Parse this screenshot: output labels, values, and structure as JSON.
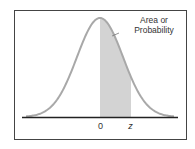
{
  "diagram": {
    "type": "standard-normal-curve",
    "annotation_line1": "Area or",
    "annotation_line2": "Probability",
    "axis_labels": {
      "zero": "0",
      "z": "z"
    },
    "colors": {
      "curve": "#a8a8a8",
      "shade": "#d3d3d3",
      "axis": "#222222",
      "border": "#444444"
    }
  }
}
